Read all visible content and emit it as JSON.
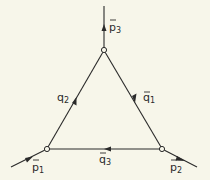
{
  "diagram": {
    "type": "feynman-triangle",
    "background": "#f7f6ea",
    "ink": "#2a2a2a",
    "vertices": {
      "top": {
        "x": 104,
        "y": 50
      },
      "left": {
        "x": 47,
        "y": 149
      },
      "right": {
        "x": 162,
        "y": 149
      }
    },
    "external_lines": [
      {
        "id": "p3",
        "label": "p",
        "subscript": "3",
        "bar": true,
        "arrow": "up"
      },
      {
        "id": "p1",
        "label": "p",
        "subscript": "1",
        "bar": true,
        "arrow": "toward-vertex"
      },
      {
        "id": "p2",
        "label": "p",
        "subscript": "2",
        "bar": true,
        "arrow": "away-from-vertex"
      }
    ],
    "internal_lines": [
      {
        "id": "q2",
        "label": "q",
        "subscript": "2",
        "bar": false,
        "arrow": "toward-top"
      },
      {
        "id": "q1",
        "label": "q",
        "subscript": "1",
        "bar": true,
        "arrow": "toward-bottom-right"
      },
      {
        "id": "q3",
        "label": "q",
        "subscript": "3",
        "bar": true,
        "arrow": "toward-left"
      }
    ]
  }
}
